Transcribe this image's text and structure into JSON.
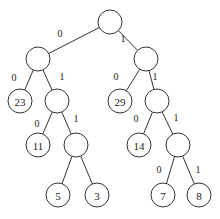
{
  "diagram": {
    "type": "binary-tree",
    "nodes": [
      {
        "id": "root",
        "label": "",
        "x": 110,
        "y": 22
      },
      {
        "id": "n0",
        "label": "",
        "x": 38,
        "y": 59
      },
      {
        "id": "n1",
        "label": "",
        "x": 146,
        "y": 59
      },
      {
        "id": "n00",
        "label": "23",
        "x": 20,
        "y": 101
      },
      {
        "id": "n01",
        "label": "",
        "x": 57,
        "y": 101
      },
      {
        "id": "n10",
        "label": "29",
        "x": 120,
        "y": 101
      },
      {
        "id": "n11",
        "label": "",
        "x": 157,
        "y": 101
      },
      {
        "id": "n010",
        "label": "11",
        "x": 38,
        "y": 145
      },
      {
        "id": "n011",
        "label": "",
        "x": 76,
        "y": 145
      },
      {
        "id": "n110",
        "label": "14",
        "x": 139,
        "y": 145
      },
      {
        "id": "n111",
        "label": "",
        "x": 178,
        "y": 145
      },
      {
        "id": "n0110",
        "label": "5",
        "x": 58,
        "y": 195
      },
      {
        "id": "n0111",
        "label": "3",
        "x": 97,
        "y": 195
      },
      {
        "id": "n1110",
        "label": "7",
        "x": 163,
        "y": 195
      },
      {
        "id": "n1111",
        "label": "8",
        "x": 199,
        "y": 195
      }
    ],
    "edges": [
      {
        "from": "root",
        "to": "n0",
        "label": "0",
        "lx": 60,
        "ly": 33
      },
      {
        "from": "root",
        "to": "n1",
        "label": "1",
        "lx": 123,
        "ly": 38
      },
      {
        "from": "n0",
        "to": "n00",
        "label": "0",
        "lx": 14,
        "ly": 77
      },
      {
        "from": "n0",
        "to": "n01",
        "label": "1",
        "lx": 62,
        "ly": 76
      },
      {
        "from": "n1",
        "to": "n10",
        "label": "0",
        "lx": 116,
        "ly": 76
      },
      {
        "from": "n1",
        "to": "n11",
        "label": "1",
        "lx": 155,
        "ly": 76
      },
      {
        "from": "n01",
        "to": "n010",
        "label": "0",
        "lx": 37,
        "ly": 123
      },
      {
        "from": "n01",
        "to": "n011",
        "label": "1",
        "lx": 76,
        "ly": 118
      },
      {
        "from": "n11",
        "to": "n110",
        "label": "0",
        "lx": 136,
        "ly": 118
      },
      {
        "from": "n11",
        "to": "n111",
        "label": "1",
        "lx": 176,
        "ly": 117
      },
      {
        "from": "n011",
        "to": "n0110",
        "label": "",
        "lx": 0,
        "ly": 0
      },
      {
        "from": "n011",
        "to": "n0111",
        "label": "",
        "lx": 0,
        "ly": 0
      },
      {
        "from": "n111",
        "to": "n1110",
        "label": "0",
        "lx": 159,
        "ly": 169
      },
      {
        "from": "n111",
        "to": "n1111",
        "label": "1",
        "lx": 198,
        "ly": 169
      }
    ],
    "node_radius": 12,
    "colors": {
      "stroke": "#333333",
      "fill": "#ffffff",
      "text": "#222222"
    }
  }
}
